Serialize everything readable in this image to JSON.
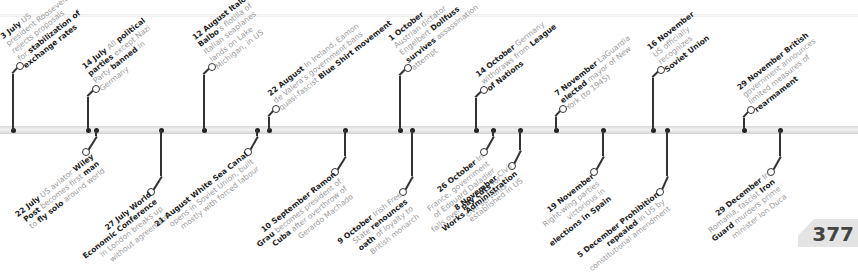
{
  "page_number": "377",
  "events_above": [
    {
      "id": "jul3",
      "axis_x": 13,
      "ring_x": 20,
      "ring_y": 62,
      "parts": [
        [
          "b",
          "3 July"
        ],
        [
          "t",
          " US"
        ],
        [
          "br"
        ],
        [
          "t",
          "president Roosevelt"
        ],
        [
          "br"
        ],
        [
          "t",
          "rejects proposals"
        ],
        [
          "br"
        ],
        [
          "t",
          "for "
        ],
        [
          "b",
          "stabilization of"
        ],
        [
          "br"
        ],
        [
          "b",
          "exchange rates"
        ]
      ]
    },
    {
      "id": "jul14",
      "axis_x": 88,
      "ring_x": 96,
      "ring_y": 85,
      "parts": [
        [
          "b",
          "14 July"
        ],
        [
          "t",
          " All "
        ],
        [
          "b",
          "political"
        ],
        [
          "br"
        ],
        [
          "b",
          "parties"
        ],
        [
          "t",
          " except Nazi"
        ],
        [
          "br"
        ],
        [
          "t",
          "Party "
        ],
        [
          "b",
          "banned"
        ],
        [
          "t",
          " in"
        ],
        [
          "br"
        ],
        [
          "t",
          "Germany"
        ]
      ]
    },
    {
      "id": "aug12",
      "axis_x": 204,
      "ring_x": 212,
      "ring_y": 63,
      "parts": [
        [
          "b",
          "12 August Italo"
        ],
        [
          "br"
        ],
        [
          "b",
          "Balbo"
        ],
        [
          "t",
          "'s flotilla of"
        ],
        [
          "br"
        ],
        [
          "t",
          "Italian seaplanes"
        ],
        [
          "br"
        ],
        [
          "t",
          "lands on Lake"
        ],
        [
          "br"
        ],
        [
          "t",
          "Michigan, in US"
        ]
      ]
    },
    {
      "id": "aug22",
      "axis_x": 269,
      "ring_x": 276,
      "ring_y": 105,
      "parts": [
        [
          "b",
          "22 August"
        ],
        [
          "t",
          " In Ireland, Eamon"
        ],
        [
          "br"
        ],
        [
          "t",
          "de Valera's government bans"
        ],
        [
          "br"
        ],
        [
          "t",
          "quasi-fascist "
        ],
        [
          "b",
          "Blue Shirt movement"
        ]
      ]
    },
    {
      "id": "oct1",
      "axis_x": 400,
      "ring_x": 408,
      "ring_y": 64,
      "parts": [
        [
          "b",
          "1 October"
        ],
        [
          "br"
        ],
        [
          "t",
          "Austrian dictator"
        ],
        [
          "br"
        ],
        [
          "t",
          "Engelbert "
        ],
        [
          "b",
          "Dollfuss"
        ],
        [
          "br"
        ],
        [
          "b",
          "survives"
        ],
        [
          "t",
          " assassination"
        ],
        [
          "br"
        ],
        [
          "t",
          "attempt"
        ]
      ]
    },
    {
      "id": "oct14",
      "axis_x": 476,
      "ring_x": 484,
      "ring_y": 86,
      "parts": [
        [
          "b",
          "14 October"
        ],
        [
          "t",
          " Germany"
        ],
        [
          "br"
        ],
        [
          "t",
          "withdraws from "
        ],
        [
          "b",
          "League"
        ],
        [
          "br"
        ],
        [
          "b",
          "of Nations"
        ]
      ]
    },
    {
      "id": "nov7",
      "axis_x": 556,
      "ring_x": 563,
      "ring_y": 105,
      "parts": [
        [
          "b",
          "7 November"
        ],
        [
          "t",
          " LaGuardia"
        ],
        [
          "br"
        ],
        [
          "b",
          "elected"
        ],
        [
          "t",
          " mayor of New"
        ],
        [
          "br"
        ],
        [
          "t",
          "York (to 1945)"
        ]
      ]
    },
    {
      "id": "nov16",
      "axis_x": 653,
      "ring_x": 661,
      "ring_y": 66,
      "parts": [
        [
          "b",
          "16 November"
        ],
        [
          "br"
        ],
        [
          "t",
          "US officially"
        ],
        [
          "br"
        ],
        [
          "t",
          "recognizes"
        ],
        [
          "br"
        ],
        [
          "b",
          "Soviet Union"
        ]
      ]
    },
    {
      "id": "nov29",
      "axis_x": 744,
      "ring_x": 751,
      "ring_y": 106,
      "parts": [
        [
          "b",
          "29 November"
        ],
        [
          "b",
          " British"
        ],
        [
          "br"
        ],
        [
          "t",
          "government announces"
        ],
        [
          "br"
        ],
        [
          "t",
          "limited measures of"
        ],
        [
          "br"
        ],
        [
          "b",
          "rearmament"
        ]
      ]
    }
  ],
  "events_below": [
    {
      "id": "jul22",
      "axis_x": 96,
      "ring_x": 86,
      "ring_y": 148,
      "parts": [
        [
          "b",
          "22 July"
        ],
        [
          "t",
          " US aviator "
        ],
        [
          "b",
          "Wiley"
        ],
        [
          "br"
        ],
        [
          "b",
          "Post"
        ],
        [
          "t",
          " becomes first "
        ],
        [
          "b",
          "man"
        ],
        [
          "br"
        ],
        [
          "t",
          "to "
        ],
        [
          "b",
          "fly solo"
        ],
        [
          "t",
          " around world"
        ]
      ]
    },
    {
      "id": "jul27",
      "axis_x": 161,
      "ring_x": 151,
      "ring_y": 188,
      "parts": [
        [
          "b",
          "27 July World"
        ],
        [
          "br"
        ],
        [
          "b",
          "Economic Conference"
        ],
        [
          "br"
        ],
        [
          "t",
          "in London breaks up"
        ],
        [
          "br"
        ],
        [
          "t",
          "without agreement"
        ]
      ]
    },
    {
      "id": "aug21",
      "axis_x": 257,
      "ring_x": 248,
      "ring_y": 148,
      "parts": [
        [
          "b",
          "21 August White Sea Canal"
        ],
        [
          "br"
        ],
        [
          "t",
          "opens in Soviet Union, built"
        ],
        [
          "br"
        ],
        [
          "t",
          "mostly with forced labour"
        ]
      ]
    },
    {
      "id": "sep10",
      "axis_x": 345,
      "ring_x": 335,
      "ring_y": 168,
      "parts": [
        [
          "b",
          "10 September Ramon"
        ],
        [
          "br"
        ],
        [
          "b",
          "Grau"
        ],
        [
          "t",
          " becomes president of"
        ],
        [
          "br"
        ],
        [
          "b",
          "Cuba"
        ],
        [
          "t",
          " after overthrow of"
        ],
        [
          "br"
        ],
        [
          "t",
          "Gerardo Machado"
        ]
      ]
    },
    {
      "id": "oct9",
      "axis_x": 412,
      "ring_x": 403,
      "ring_y": 188,
      "parts": [
        [
          "b",
          "9 October"
        ],
        [
          "t",
          " Irish Free"
        ],
        [
          "br"
        ],
        [
          "t",
          "State "
        ],
        [
          "b",
          "renounces"
        ],
        [
          "br"
        ],
        [
          "b",
          "oath"
        ],
        [
          "t",
          " of loyalty to"
        ],
        [
          "br"
        ],
        [
          "t",
          "British monarch"
        ]
      ]
    },
    {
      "id": "oct26",
      "axis_x": 493,
      "ring_x": 484,
      "ring_y": 148,
      "parts": [
        [
          "b",
          "26 October"
        ],
        [
          "t",
          " In"
        ],
        [
          "br"
        ],
        [
          "t",
          "France, government"
        ],
        [
          "br"
        ],
        [
          "t",
          "of Edouard Daladier"
        ],
        [
          "br"
        ],
        [
          "t",
          "falls over "
        ],
        [
          "b",
          "pay cuts"
        ],
        [
          "t",
          " for"
        ],
        [
          "br"
        ],
        [
          "t",
          "civil servants"
        ]
      ]
    },
    {
      "id": "nov19",
      "axis_x": 603,
      "ring_x": 594,
      "ring_y": 168,
      "parts": [
        [
          "b",
          "19 November"
        ],
        [
          "br"
        ],
        [
          "t",
          "Right-wing parties"
        ],
        [
          "br"
        ],
        [
          "t",
          "victorious in"
        ],
        [
          "br"
        ],
        [
          "b",
          "elections in Spain"
        ]
      ]
    },
    {
      "id": "dec5",
      "axis_x": 667,
      "ring_x": 660,
      "ring_y": 188,
      "parts": [
        [
          "b",
          "5 December Prohibition"
        ],
        [
          "br"
        ],
        [
          "b",
          "repealed"
        ],
        [
          "t",
          " in US by"
        ],
        [
          "br"
        ],
        [
          "t",
          "constitutional amendment"
        ]
      ]
    },
    {
      "id": "nov8",
      "axis_x": 520,
      "ring_x": 512,
      "ring_y": 162,
      "parts": [
        [
          "b",
          "8 November"
        ],
        [
          "t",
          " Civil"
        ],
        [
          "br"
        ],
        [
          "b",
          "Works Administration"
        ],
        [
          "br"
        ],
        [
          "t",
          "established in US"
        ]
      ]
    },
    {
      "id": "dec29_a",
      "axis_x": 780,
      "ring_x": 771,
      "ring_y": 168,
      "parts": [
        [
          "b",
          "29 December"
        ],
        [
          "t",
          " In"
        ],
        [
          "br"
        ],
        [
          "t",
          "Romania, fascist "
        ],
        [
          "b",
          "Iron"
        ],
        [
          "br"
        ],
        [
          "b",
          "Guard"
        ],
        [
          "t",
          " murders prime"
        ],
        [
          "br"
        ],
        [
          "t",
          "minister Ion Duca"
        ]
      ]
    }
  ],
  "below_label_offsets": {
    "jul22": [
      92,
      152
    ],
    "jul27": [
      150,
      190
    ],
    "aug21": [
      246,
      150
    ],
    "sep10": [
      334,
      170
    ],
    "oct9": [
      400,
      190
    ],
    "oct26": [
      482,
      152
    ],
    "nov19": [
      592,
      172
    ],
    "dec5": [
      657,
      190
    ],
    "nov8": [
      510,
      162
    ],
    "dec29_a": [
      768,
      170
    ]
  }
}
